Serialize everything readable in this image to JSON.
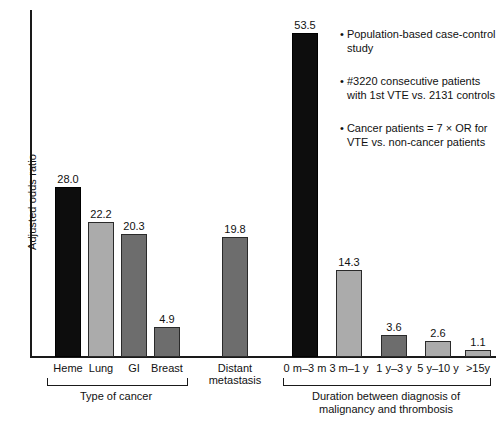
{
  "chart_data": {
    "type": "bar",
    "title": "",
    "xlabel": "",
    "ylabel": "Adjusted odds ratio",
    "ylim": [
      0,
      56
    ],
    "grid": false,
    "legend": "none",
    "categories": [
      "Heme",
      "Lung",
      "GI",
      "Breast",
      "Distant metastasis",
      "0 m–3 m",
      "3 m–1 y",
      "1 y–3 y",
      "5 y–10 y",
      ">15y"
    ],
    "values": [
      28.0,
      22.2,
      20.3,
      4.9,
      19.8,
      53.5,
      14.3,
      3.6,
      2.6,
      1.1
    ],
    "bars": [
      {
        "label": "Heme",
        "value": 28.0,
        "value_text": "28.0",
        "shade": "black",
        "x": 55,
        "w": 26,
        "group": 0
      },
      {
        "label": "Lung",
        "value": 22.2,
        "value_text": "22.2",
        "shade": "light",
        "x": 88,
        "w": 26,
        "group": 0
      },
      {
        "label": "GI",
        "value": 20.3,
        "value_text": "20.3",
        "shade": "dark",
        "x": 121,
        "w": 26,
        "group": 0
      },
      {
        "label": "Breast",
        "value": 4.9,
        "value_text": "4.9",
        "shade": "dark",
        "x": 154,
        "w": 26,
        "group": 0
      },
      {
        "label": "Distant metastasis",
        "value": 19.8,
        "value_text": "19.8",
        "shade": "dark",
        "x": 222,
        "w": 26,
        "group": 1
      },
      {
        "label": "0 m–3 m",
        "value": 53.5,
        "value_text": "53.5",
        "shade": "black",
        "x": 292,
        "w": 26,
        "group": 2
      },
      {
        "label": "3 m–1 y",
        "value": 14.3,
        "value_text": "14.3",
        "shade": "light",
        "x": 336,
        "w": 26,
        "group": 2
      },
      {
        "label": "1 y–3 y",
        "value": 3.6,
        "value_text": "3.6",
        "shade": "dark",
        "x": 381,
        "w": 26,
        "group": 2
      },
      {
        "label": "5 y–10 y",
        "value": 2.6,
        "value_text": "2.6",
        "shade": "light",
        "x": 425,
        "w": 26,
        "group": 2
      },
      {
        "label": ">15y",
        "value": 1.1,
        "value_text": "1.1",
        "shade": "light",
        "x": 465,
        "w": 26,
        "group": 2
      }
    ],
    "tick_labels": [
      {
        "text": "Heme",
        "cx": 68,
        "lines": [
          "Heme"
        ]
      },
      {
        "text": "Lung",
        "cx": 101,
        "lines": [
          "Lung"
        ]
      },
      {
        "text": "GI",
        "cx": 134,
        "lines": [
          "GI"
        ]
      },
      {
        "text": "Breast",
        "cx": 167,
        "lines": [
          "Breast"
        ]
      },
      {
        "text": "Distant metastasis",
        "cx": 235,
        "lines": [
          "Distant",
          "metastasis"
        ]
      },
      {
        "text": "0 m–3 m",
        "cx": 305,
        "lines": [
          "0 m–3 m"
        ]
      },
      {
        "text": "3 m–1 y",
        "cx": 349,
        "lines": [
          "3 m–1 y"
        ]
      },
      {
        "text": "1 y–3 y",
        "cx": 394,
        "lines": [
          "1 y–3 y"
        ]
      },
      {
        "text": "5 y–10 y",
        "cx": 438,
        "lines": [
          "5 y–10 y"
        ]
      },
      {
        "text": ">15y",
        "cx": 478,
        "lines": [
          ">15y"
        ]
      }
    ],
    "groups": [
      {
        "label": "Type of cancer",
        "left": 47,
        "right": 186,
        "label_cx": 116
      },
      {
        "label": "Duration between diagnosis of malignancy and thrombosis",
        "left": 283,
        "right": 489,
        "label_cx": 386,
        "lines": [
          "Duration between diagnosis of",
          "malignancy and thrombosis"
        ]
      }
    ],
    "annotations": [
      "• Population-based case-control study",
      "• #3220 consecutive patients with 1st VTE vs. 2131 controls",
      "• Cancer patients = 7 × OR for VTE vs. non-cancer patients"
    ],
    "colors": {
      "black": "#0d0d0d",
      "dark_gray": "#6d6d6d",
      "light_gray": "#ababab",
      "axis": "#1a1a1a",
      "text": "#111111",
      "background": "#ffffff"
    },
    "scale": {
      "baseline_y": 357,
      "px_per_unit": 6.06
    }
  }
}
